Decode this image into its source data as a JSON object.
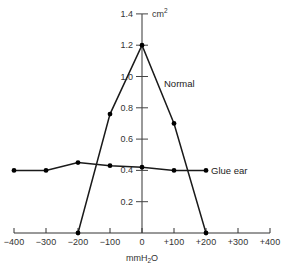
{
  "chart_data": {
    "type": "line",
    "title": "",
    "xlabel": "mmH2O",
    "xlabel_display": "mmH",
    "xlabel_sub": "2",
    "xlabel_tail": "O",
    "ylabel": "cm2",
    "ylabel_display": "cm",
    "ylabel_sup": "2",
    "xlim": [
      -400,
      400
    ],
    "ylim": [
      0,
      1.4
    ],
    "x_ticks": [
      -400,
      -300,
      -200,
      -100,
      0,
      100,
      200,
      300,
      400
    ],
    "x_tick_labels": [
      "−400",
      "−300",
      "−200",
      "−100",
      "0",
      "+100",
      "+200",
      "+300",
      "+400"
    ],
    "y_ticks": [
      0.2,
      0.4,
      0.6,
      0.8,
      1.0,
      1.2,
      1.4
    ],
    "y_tick_labels": [
      "0.2",
      "0.4",
      "0.6",
      "0.8",
      "1.0",
      "1.2",
      "1.4"
    ],
    "grid": false,
    "legend": "inline labels",
    "series": [
      {
        "name": "Normal",
        "x": [
          -200,
          -100,
          0,
          100,
          200
        ],
        "values": [
          0.0,
          0.76,
          1.2,
          0.7,
          0.0
        ]
      },
      {
        "name": "Glue ear",
        "x": [
          -400,
          -300,
          -200,
          -100,
          0,
          100,
          200
        ],
        "values": [
          0.4,
          0.4,
          0.45,
          0.43,
          0.42,
          0.4,
          0.4
        ]
      }
    ]
  }
}
